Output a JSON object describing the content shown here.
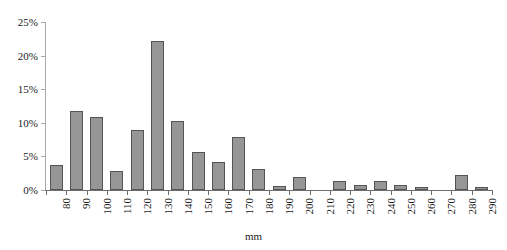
{
  "chart_data": {
    "type": "bar",
    "title": "",
    "subtitle": "",
    "xlabel": "mm",
    "ylabel": "",
    "categories": [
      "80",
      "90",
      "100",
      "110",
      "120",
      "130",
      "140",
      "150",
      "160",
      "170",
      "180",
      "190",
      "200",
      "210",
      "220",
      "230",
      "240",
      "250",
      "260",
      "270",
      "280",
      "290"
    ],
    "values": [
      3.7,
      11.8,
      10.8,
      2.8,
      9.0,
      22.2,
      10.2,
      5.6,
      4.2,
      7.9,
      3.1,
      0.6,
      2.0,
      0.0,
      1.3,
      0.7,
      1.3,
      0.7,
      0.4,
      0.0,
      2.2,
      0.5
    ],
    "ylim": [
      0,
      25
    ],
    "ytick_values": [
      0,
      5,
      10,
      15,
      20,
      25
    ],
    "ytick_labels": [
      "0%",
      "5%",
      "10%",
      "15%",
      "20%",
      "25%"
    ],
    "grid": false,
    "legend": false,
    "legend_position": "none",
    "bar_fill_color": "#969696",
    "bar_border_color": "#545454",
    "axis_color": "#6e6e6e",
    "xtick_label_rotation": -90
  }
}
